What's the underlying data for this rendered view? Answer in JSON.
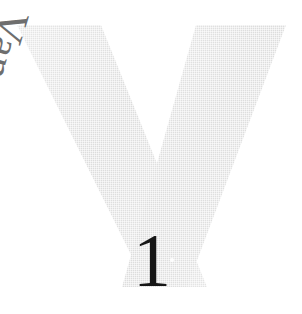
{
  "page": {
    "background_color": "#ffffff",
    "width": 302,
    "height": 314,
    "kind": "scanned-book-page"
  },
  "glyph": {
    "letter": "V",
    "role": "large-decorative-initial",
    "fill_color": "#e0e0e0",
    "edge_color": "#cfcfcf",
    "texture": "halftone-dither"
  },
  "heading": {
    "text": "Van",
    "color": "#6e6e6e",
    "rotation_degrees": 107,
    "style": "serif"
  },
  "page_number": {
    "text": "1",
    "color": "#161616",
    "style": "serif"
  },
  "artifacts": {
    "speck_label": "scan-speck"
  }
}
